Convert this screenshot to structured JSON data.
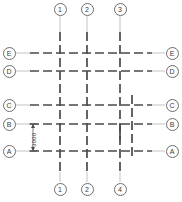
{
  "drawing": {
    "title": "Structural Grid Plan",
    "type": "architectural-column-grid",
    "units": "mm",
    "line_color": "#4a4a4a",
    "leader_color": "#9a9a9a",
    "bubble_border_color": "#6e6e6e",
    "background_color": "#ffffff"
  },
  "grid": {
    "column_axes": [
      {
        "id": "c1",
        "x": 60,
        "y_top": 32,
        "y_bottom": 172,
        "style": "dashed",
        "full_height": true
      },
      {
        "id": "c2",
        "x": 87,
        "y_top": 32,
        "y_bottom": 172,
        "style": "dashed",
        "full_height": true
      },
      {
        "id": "c3",
        "x": 120,
        "y_top": 32,
        "y_bottom": 172,
        "style": "dashed",
        "full_height": true
      },
      {
        "id": "c4",
        "x": 132,
        "y_top": 95,
        "y_bottom": 160,
        "style": "dashed",
        "full_height": false
      }
    ],
    "row_axes": [
      {
        "id": "rE",
        "y": 53,
        "x_left": 30,
        "x_right": 152,
        "style": "dashed"
      },
      {
        "id": "rD",
        "y": 71,
        "x_left": 30,
        "x_right": 152,
        "style": "dashed"
      },
      {
        "id": "rC",
        "y": 105,
        "x_left": 30,
        "x_right": 152,
        "style": "dashed"
      },
      {
        "id": "rB",
        "y": 124,
        "x_left": 30,
        "x_right": 152,
        "style": "dashed"
      },
      {
        "id": "rA",
        "y": 151,
        "x_left": 30,
        "x_right": 152,
        "style": "dashed"
      }
    ],
    "stub": {
      "x": 120,
      "y_top": 124,
      "y_bottom": 140
    }
  },
  "labels": {
    "top": [
      {
        "text": "1",
        "x": 60,
        "y": 9
      },
      {
        "text": "2",
        "x": 87,
        "y": 9
      },
      {
        "text": "3",
        "x": 120,
        "y": 9
      }
    ],
    "bottom": [
      {
        "text": "1",
        "x": 60,
        "y": 189
      },
      {
        "text": "2",
        "x": 87,
        "y": 189
      },
      {
        "text": "4",
        "x": 120,
        "y": 189
      }
    ],
    "left": [
      {
        "text": "E",
        "y": 53,
        "x": 9
      },
      {
        "text": "D",
        "y": 71,
        "x": 9
      },
      {
        "text": "C",
        "y": 105,
        "x": 9
      },
      {
        "text": "B",
        "y": 124,
        "x": 9
      },
      {
        "text": "A",
        "y": 151,
        "x": 9
      }
    ],
    "right": [
      {
        "text": "E",
        "y": 53,
        "x": 172
      },
      {
        "text": "D",
        "y": 71,
        "x": 172
      },
      {
        "text": "C",
        "y": 105,
        "x": 172
      },
      {
        "text": "B",
        "y": 124,
        "x": 172
      },
      {
        "text": "A",
        "y": 151,
        "x": 172
      }
    ]
  },
  "dimensions": [
    {
      "id": "dim-B-A",
      "value": "3000",
      "orientation": "vertical",
      "x": 33,
      "y_from": 124,
      "y_to": 151,
      "text_x": 31,
      "text_y": 147
    }
  ]
}
